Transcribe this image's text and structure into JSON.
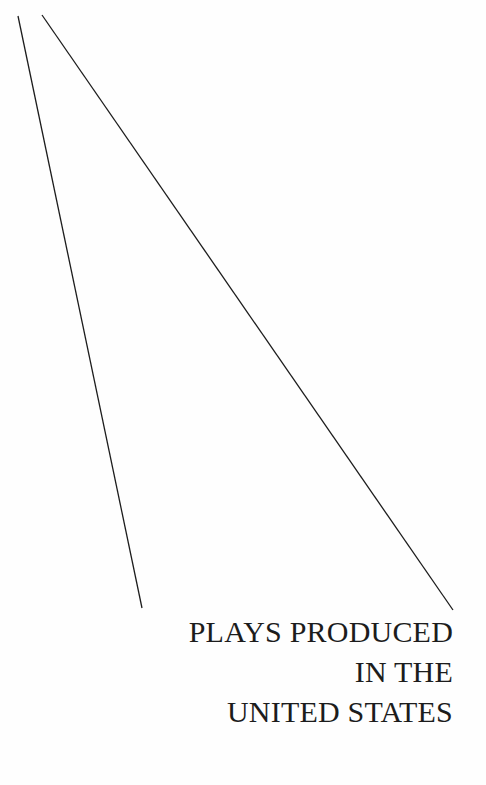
{
  "page": {
    "title_lines": [
      "PLAYS PRODUCED",
      "IN THE",
      "UNITED STATES"
    ],
    "colors": {
      "background": "#fefefe",
      "ink": "#1c1c1c"
    }
  }
}
